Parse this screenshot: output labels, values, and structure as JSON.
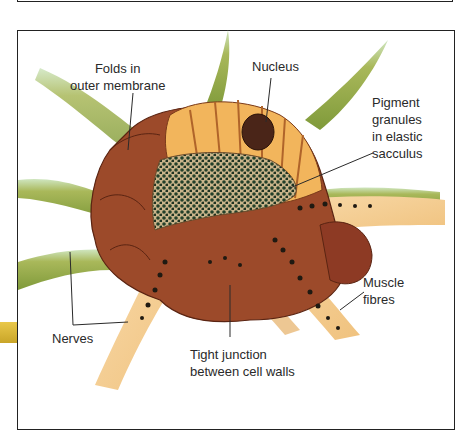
{
  "diagram": {
    "labels": {
      "folds": [
        "Folds in",
        "outer membrane"
      ],
      "nucleus": "Nucleus",
      "pigment": [
        "Pigment",
        "granules",
        "in elastic",
        "sacculus"
      ],
      "muscle": [
        "Muscle",
        "fibres"
      ],
      "nerves": "Nerves",
      "tight_junction": [
        "Tight junction",
        "between cell walls"
      ]
    },
    "colors": {
      "outer_membrane": "#9c4a2a",
      "cell_body": "#f2b55c",
      "pigment_core": "#2f4a2e",
      "nerve_green": "#a9b85a",
      "muscle_fibre": "#f6d7a4",
      "granule": "#1f1a12",
      "frame": "#222222"
    }
  }
}
